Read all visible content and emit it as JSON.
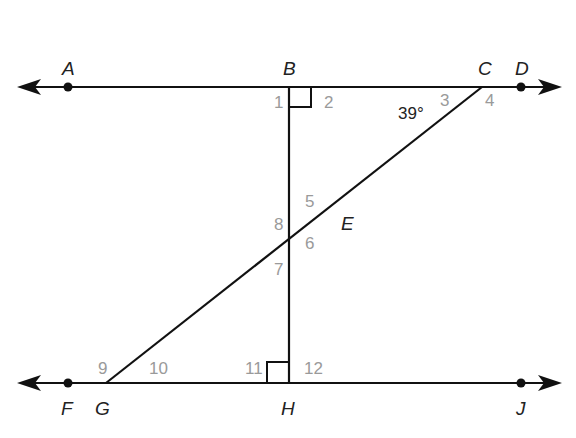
{
  "diagram": {
    "points": {
      "A": "A",
      "B": "B",
      "C": "C",
      "D": "D",
      "E": "E",
      "F": "F",
      "G": "G",
      "H": "H",
      "J": "J"
    },
    "angles": {
      "a1": "1",
      "a2": "2",
      "a3": "3",
      "a4": "4",
      "a5": "5",
      "a6": "6",
      "a7": "7",
      "a8": "8",
      "a9": "9",
      "a10": "10",
      "a11": "11",
      "a12": "12"
    },
    "measure": "39°",
    "colors": {
      "line": "#111111",
      "angle_number": "#9a9a9a",
      "label": "#222222"
    }
  }
}
